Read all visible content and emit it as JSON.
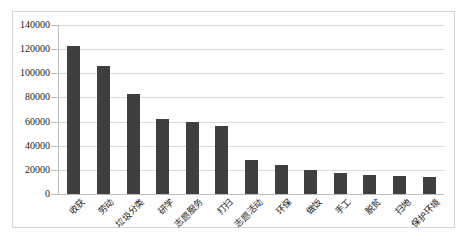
{
  "chart_data": {
    "type": "bar",
    "title": "",
    "xlabel": "",
    "ylabel": "",
    "ylim": [
      0,
      140000
    ],
    "ytick_step": 20000,
    "yticks": [
      "0",
      "20000",
      "40000",
      "60000",
      "80000",
      "100000",
      "120000",
      "140000"
    ],
    "grid": true,
    "legend": "none",
    "bar_color": "#3f3f3f",
    "gridline_color": "#d9d9d9",
    "axis_color": "#bfbfbf",
    "border_color": "#d4d4d4",
    "categories": [
      "收获",
      "劳动",
      "垃圾分类",
      "研学",
      "志愿服务",
      "打扫",
      "志愿活动",
      "环保",
      "做饭",
      "手工",
      "脱贫",
      "扫地",
      "保护环境"
    ],
    "values": [
      123000,
      106000,
      83000,
      62000,
      60000,
      56000,
      28000,
      24000,
      20000,
      17000,
      16000,
      15000,
      14000
    ]
  }
}
